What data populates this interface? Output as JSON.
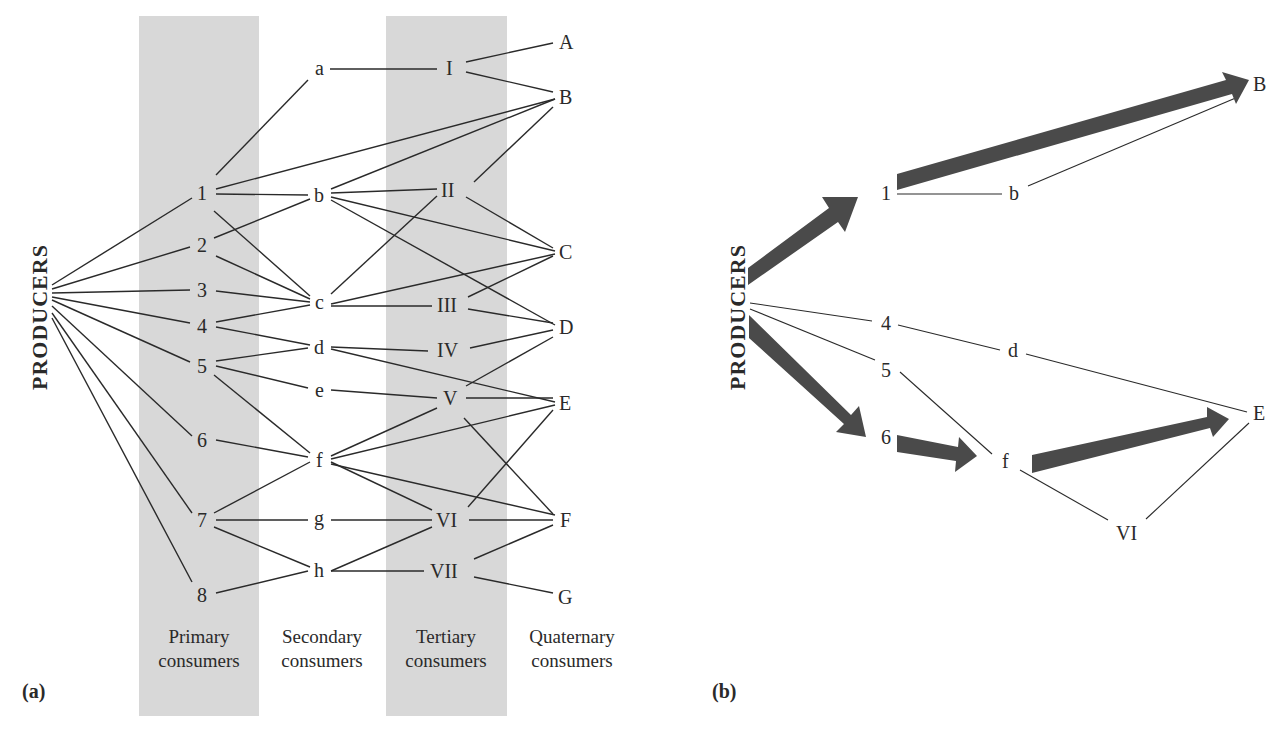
{
  "figure": {
    "panel_a": {
      "label": "(a)",
      "producers_label": "PRODUCERS",
      "levels": [
        {
          "id": "primary",
          "line1": "Primary",
          "line2": "consumers",
          "shaded": true
        },
        {
          "id": "secondary",
          "line1": "Secondary",
          "line2": "consumers",
          "shaded": false
        },
        {
          "id": "tertiary",
          "line1": "Tertiary",
          "line2": "consumers",
          "shaded": true
        },
        {
          "id": "quaternary",
          "line1": "Quaternary",
          "line2": "consumers",
          "shaded": false
        }
      ],
      "nodes": {
        "primary": [
          "1",
          "2",
          "3",
          "4",
          "5",
          "6",
          "7",
          "8"
        ],
        "secondary": [
          "a",
          "b",
          "c",
          "d",
          "e",
          "f",
          "g",
          "h"
        ],
        "tertiary": [
          "I",
          "II",
          "III",
          "IV",
          "V",
          "VI",
          "VII"
        ],
        "quaternary": [
          "A",
          "B",
          "C",
          "D",
          "E",
          "F",
          "G"
        ]
      },
      "edges": [
        [
          "P",
          "1"
        ],
        [
          "P",
          "2"
        ],
        [
          "P",
          "3"
        ],
        [
          "P",
          "4"
        ],
        [
          "P",
          "5"
        ],
        [
          "P",
          "6"
        ],
        [
          "P",
          "7"
        ],
        [
          "P",
          "8"
        ],
        [
          "1",
          "a"
        ],
        [
          "1",
          "B"
        ],
        [
          "1",
          "b"
        ],
        [
          "1",
          "c"
        ],
        [
          "2",
          "b"
        ],
        [
          "2",
          "c"
        ],
        [
          "3",
          "c"
        ],
        [
          "4",
          "c"
        ],
        [
          "4",
          "d"
        ],
        [
          "5",
          "d"
        ],
        [
          "5",
          "e"
        ],
        [
          "5",
          "f"
        ],
        [
          "6",
          "f"
        ],
        [
          "7",
          "f"
        ],
        [
          "7",
          "g"
        ],
        [
          "7",
          "h"
        ],
        [
          "8",
          "h"
        ],
        [
          "a",
          "I"
        ],
        [
          "b",
          "B"
        ],
        [
          "b",
          "II"
        ],
        [
          "b",
          "C"
        ],
        [
          "b",
          "D"
        ],
        [
          "c",
          "II"
        ],
        [
          "c",
          "C"
        ],
        [
          "c",
          "III"
        ],
        [
          "d",
          "IV"
        ],
        [
          "d",
          "E"
        ],
        [
          "e",
          "V"
        ],
        [
          "f",
          "V"
        ],
        [
          "f",
          "E"
        ],
        [
          "f",
          "VI"
        ],
        [
          "f",
          "F"
        ],
        [
          "g",
          "VI"
        ],
        [
          "h",
          "VI"
        ],
        [
          "h",
          "VII"
        ],
        [
          "I",
          "A"
        ],
        [
          "I",
          "B"
        ],
        [
          "II",
          "B"
        ],
        [
          "II",
          "C"
        ],
        [
          "III",
          "C"
        ],
        [
          "III",
          "D"
        ],
        [
          "IV",
          "D"
        ],
        [
          "V",
          "D"
        ],
        [
          "V",
          "E"
        ],
        [
          "V",
          "F"
        ],
        [
          "VI",
          "E"
        ],
        [
          "VI",
          "F"
        ],
        [
          "VII",
          "F"
        ],
        [
          "VII",
          "G"
        ]
      ]
    },
    "panel_b": {
      "label": "(b)",
      "producers_label": "PRODUCERS",
      "nodes": [
        "1",
        "b",
        "B",
        "4",
        "d",
        "5",
        "6",
        "f",
        "E",
        "VI"
      ],
      "thick_arrows": [
        [
          "P",
          "1"
        ],
        [
          "1",
          "B"
        ],
        [
          "P",
          "6"
        ],
        [
          "6",
          "f"
        ],
        [
          "f",
          "E"
        ]
      ],
      "thin_edges": [
        [
          "1",
          "b"
        ],
        [
          "b",
          "B"
        ],
        [
          "P",
          "4"
        ],
        [
          "4",
          "d"
        ],
        [
          "d",
          "E"
        ],
        [
          "P",
          "5"
        ],
        [
          "5",
          "f"
        ],
        [
          "f",
          "VI"
        ],
        [
          "VI",
          "E"
        ]
      ]
    },
    "colors": {
      "band": "#d8d8d8",
      "ink": "#2a2a2a",
      "arrow": "#4a4a4a",
      "background": "#ffffff"
    }
  }
}
